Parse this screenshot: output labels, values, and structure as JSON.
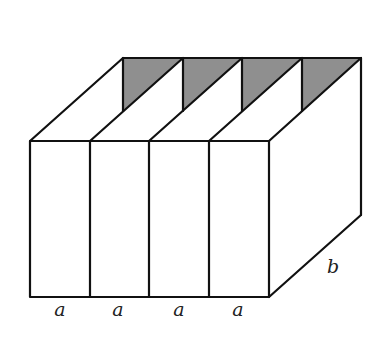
{
  "diagram": {
    "colors": {
      "stroke": "#111111",
      "shade": "#8f8f8f",
      "background": "#ffffff"
    },
    "labels": {
      "a1": "a",
      "a2": "a",
      "a3": "a",
      "a4": "a",
      "depth": "b"
    },
    "compartment_count": 4
  }
}
